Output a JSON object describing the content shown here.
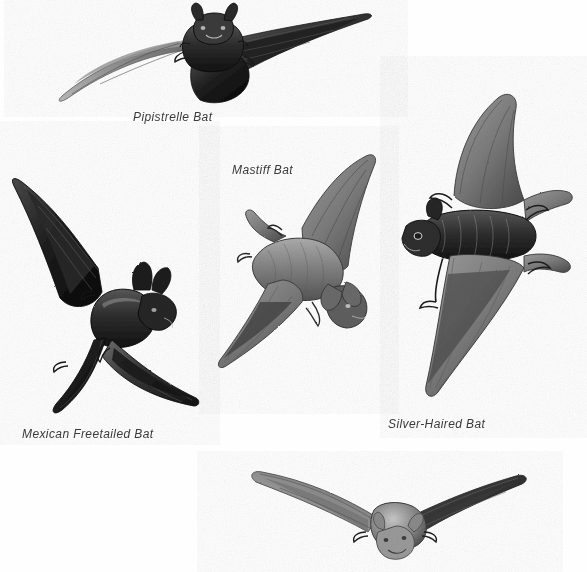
{
  "plate": {
    "title": "Bats in Flight",
    "background_color": "#fefefe",
    "text_color": "#3a3a3a",
    "width": 587,
    "height": 572,
    "medium": "grayscale pencil / scratchboard field-guide illustration"
  },
  "captions": {
    "pipistrelle": "Pipistrelle Bat",
    "mastiff": "Mastiff Bat",
    "mexican_freetailed": "Mexican Freetailed Bat",
    "silver_haired": "Silver-Haired Bat"
  },
  "figures": [
    {
      "id": "pipistrelle",
      "name": "Pipistrelle Bat",
      "label": "Pipistrelle Bat",
      "labeled": true,
      "pose": "head-on, wings fully outstretched horizontally, gliding",
      "tone": "very dark body with pale grey left wing membrane",
      "position": "top-center"
    },
    {
      "id": "mexican-freetailed",
      "name": "Mexican Freetailed Bat",
      "label": "Mexican Freetailed Bat",
      "labeled": true,
      "pose": "three-quarter view, wings swept up and down, banking",
      "tone": "darkest of the group, near-black membranes",
      "position": "left"
    },
    {
      "id": "mastiff",
      "name": "Mastiff Bat",
      "label": "Mastiff Bat",
      "labeled": true,
      "pose": "diagonal, body angled down-right, wings spread fore and aft",
      "tone": "medium grey, large translucent wing panels",
      "position": "center"
    },
    {
      "id": "silver-haired",
      "name": "Silver-Haired Bat",
      "label": "Silver-Haired Bat",
      "labeled": true,
      "pose": "side profile facing left, wings arched above and below",
      "tone": "mid to dark grey with frosted highlights on fur",
      "position": "right"
    },
    {
      "id": "unlabeled-bottom",
      "name": "bottom bat",
      "label": "",
      "labeled": false,
      "pose": "head-on, wings swept forward, approaching viewer",
      "tone": "light to medium grey with pale face",
      "position": "bottom-center"
    }
  ]
}
